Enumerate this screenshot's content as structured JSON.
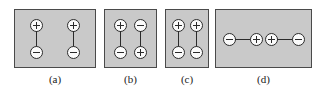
{
  "figure": {
    "background_color": "#ffffff",
    "panel_fill_color": "#c9c9c9",
    "panel_border_color": "#4a4a4a",
    "charge_fill_color": "#fbfbfb",
    "charge_stroke_color": "#2b2b2b",
    "bond_color": "#2b2b2b",
    "caption_color": "#1a1a1a",
    "panels": [
      {
        "id": "a",
        "caption": "(a)",
        "orientation": "vertical",
        "dipoles": [
          {
            "top_charge": "+",
            "bottom_charge": "-"
          },
          {
            "top_charge": "+",
            "bottom_charge": "-"
          }
        ],
        "spacing": "wide"
      },
      {
        "id": "b",
        "caption": "(b)",
        "orientation": "vertical",
        "dipoles": [
          {
            "top_charge": "+",
            "bottom_charge": "-"
          },
          {
            "top_charge": "-",
            "bottom_charge": "+"
          }
        ],
        "spacing": "narrow"
      },
      {
        "id": "c",
        "caption": "(c)",
        "orientation": "vertical",
        "dipoles": [
          {
            "top_charge": "+",
            "bottom_charge": "-"
          },
          {
            "top_charge": "+",
            "bottom_charge": "-"
          }
        ],
        "spacing": "narrow"
      },
      {
        "id": "d",
        "caption": "(d)",
        "orientation": "horizontal",
        "dipoles": [
          {
            "left_charge": "-",
            "right_charge": "+"
          },
          {
            "left_charge": "+",
            "right_charge": "-"
          }
        ],
        "spacing": "inline"
      }
    ]
  }
}
